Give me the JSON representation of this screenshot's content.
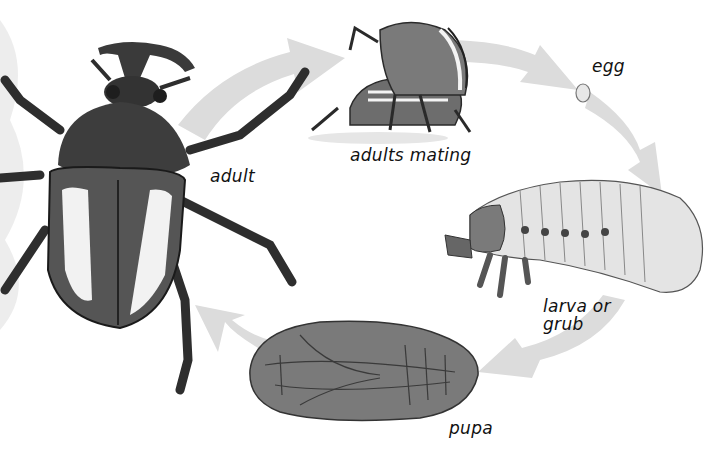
{
  "diagram": {
    "type": "cycle",
    "colors": {
      "background": "#ffffff",
      "arrow": "#d9d9d9",
      "beetle_dark": "#3a3a3a",
      "beetle_mid": "#6a6a6a",
      "pupa": "#7a7a7a",
      "larva": "#e6e6e6",
      "egg_fill": "#e8e8e8",
      "text": "#111111"
    },
    "stages": [
      {
        "id": "adult",
        "label": "adult"
      },
      {
        "id": "adults-mating",
        "label": "adults mating"
      },
      {
        "id": "egg",
        "label": "egg"
      },
      {
        "id": "larva",
        "label": "larva or\ngrub"
      },
      {
        "id": "pupa",
        "label": "pupa"
      }
    ],
    "arrows": [
      {
        "from": "adult",
        "to": "adults-mating"
      },
      {
        "from": "adults-mating",
        "to": "egg"
      },
      {
        "from": "egg",
        "to": "larva"
      },
      {
        "from": "larva",
        "to": "pupa"
      },
      {
        "from": "pupa",
        "to": "adult"
      }
    ]
  }
}
